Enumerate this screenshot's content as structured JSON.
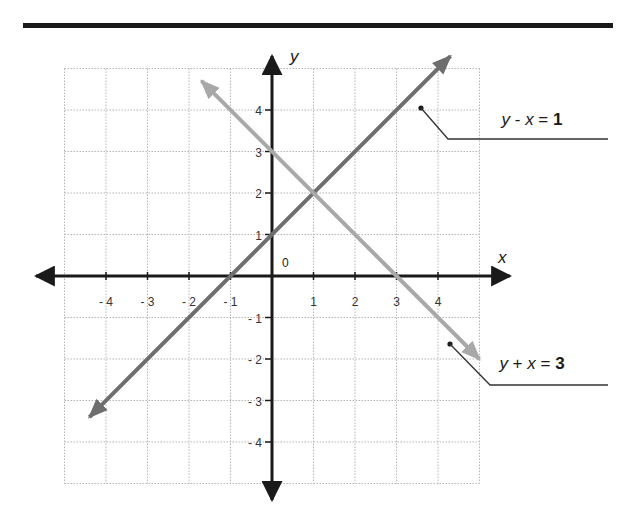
{
  "chart_data": {
    "type": "line",
    "title": "",
    "xlabel": "x",
    "ylabel": "y",
    "xlim": [
      -5,
      5
    ],
    "ylim": [
      -5,
      5
    ],
    "grid": true,
    "origin_label": "0",
    "x_ticks": [
      -4,
      -3,
      -2,
      -1,
      1,
      2,
      3,
      4
    ],
    "x_tick_labels": [
      "- 4",
      "- 3",
      "- 2",
      "- 1",
      "1",
      "2",
      "3",
      "4"
    ],
    "y_ticks": [
      4,
      3,
      2,
      1,
      -1,
      -2,
      -3,
      -4
    ],
    "y_tick_labels": [
      "4",
      "3",
      "2",
      "1",
      "- 1",
      "- 2",
      "- 3",
      "- 4"
    ],
    "series": [
      {
        "name": "y - x = 1",
        "equation": "y = x + 1",
        "color": "#6e6e6e",
        "x": [
          -4.4,
          4.3
        ],
        "y": [
          -3.4,
          5.3
        ],
        "label_parts": [
          "y",
          " - ",
          "x",
          " = ",
          "1"
        ]
      },
      {
        "name": "y + x = 3",
        "equation": "y = -x + 3",
        "color": "#a8a8a8",
        "x": [
          -1.7,
          5.0
        ],
        "y": [
          4.7,
          -2.0
        ],
        "label_parts": [
          "y",
          " + ",
          "x",
          " = ",
          "3"
        ]
      }
    ],
    "intersection": {
      "x": 1,
      "y": 2
    },
    "annotations": [
      {
        "text": "y - x = 1",
        "points_to": [
          3.6,
          4.1
        ]
      },
      {
        "text": "y + x = 3",
        "points_to": [
          4.2,
          -1.6
        ]
      }
    ]
  }
}
